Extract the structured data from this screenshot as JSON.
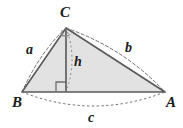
{
  "figure": {
    "kind": "geometry-diagram",
    "colors": {
      "triangle_fill": "#e2e2e2",
      "edge_stroke": "#595959",
      "arc_stroke": "#6b6b6b",
      "altitude_stroke": "#6e6e6e",
      "label_color": "#1a1a1a",
      "background": "#ffffff"
    },
    "vertices": [
      {
        "name": "C",
        "label": "C",
        "x": 66,
        "y": 28,
        "label_x": 60,
        "label_y": 5
      },
      {
        "name": "B",
        "label": "B",
        "x": 22,
        "y": 92,
        "label_x": 12,
        "label_y": 95
      },
      {
        "name": "A",
        "label": "A",
        "x": 165,
        "y": 92,
        "label_x": 166,
        "label_y": 95
      }
    ],
    "sides": [
      {
        "name": "side-a",
        "label": "a",
        "from": "B",
        "to": "C",
        "label_x": 26,
        "label_y": 43
      },
      {
        "name": "side-b",
        "label": "b",
        "from": "C",
        "to": "A",
        "label_x": 125,
        "label_y": 41
      },
      {
        "name": "side-c",
        "label": "c",
        "from": "B",
        "to": "A",
        "label_x": 88,
        "label_y": 111
      }
    ],
    "altitude": {
      "name": "altitude-h",
      "label": "h",
      "from": "C",
      "foot_x": 66,
      "foot_y": 92,
      "label_x": 74,
      "label_y": 55,
      "right_angle_mark": true
    }
  }
}
